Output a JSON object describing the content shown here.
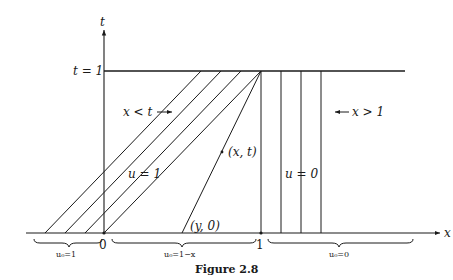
{
  "figure": {
    "caption": "Figure 2.8",
    "axes": {
      "x_label": "x",
      "t_label": "t",
      "origin_label": "0",
      "x_one_label": "1",
      "t_one_label": "t = 1"
    },
    "regions": {
      "left_arrow_label": "x < t",
      "right_arrow_label": "x > 1",
      "u_one_label": "u = 1",
      "u_zero_label": "u = 0",
      "point_label": "(x, t)",
      "foot_label": "(y, 0)"
    },
    "braces": {
      "left": "u₀=1",
      "middle": "u₀=1−x",
      "right": "u₀=0"
    },
    "characteristics": {
      "parallel_bottom_x": [
        -0.375,
        -0.25,
        -0.125,
        0.0
      ],
      "fan_point": {
        "x": 1,
        "t": 1
      },
      "fan_feet_x": [
        0.0,
        0.5
      ],
      "vertical_x": [
        1.0,
        1.125,
        1.25,
        1.375
      ]
    }
  }
}
